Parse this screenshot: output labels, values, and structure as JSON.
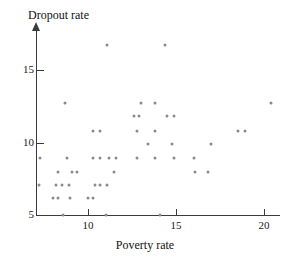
{
  "chart_data": {
    "type": "scatter",
    "title": "",
    "xlabel": "Poverty rate",
    "ylabel": "Dropout rate",
    "xlim": [
      6.6,
      21.0
    ],
    "ylim": [
      5.0,
      17.3
    ],
    "xticks": [
      10,
      15,
      20
    ],
    "xtick_labels": [
      "10",
      "15",
      "20"
    ],
    "yticks": [
      5,
      10,
      15
    ],
    "ytick_labels": [
      "5",
      "10",
      "15"
    ],
    "grid": false,
    "legend": null,
    "marker": "dot",
    "marker_color": "#8b8b8f",
    "axis_color": "#3b3b3b",
    "points": [
      {
        "x": 11.1,
        "y": 16.7
      },
      {
        "x": 14.4,
        "y": 16.7
      },
      {
        "x": 8.7,
        "y": 12.7
      },
      {
        "x": 13.0,
        "y": 12.7
      },
      {
        "x": 13.8,
        "y": 12.7
      },
      {
        "x": 20.4,
        "y": 12.7
      },
      {
        "x": 12.6,
        "y": 11.8
      },
      {
        "x": 12.9,
        "y": 11.8
      },
      {
        "x": 14.5,
        "y": 11.8
      },
      {
        "x": 14.9,
        "y": 11.8
      },
      {
        "x": 10.3,
        "y": 10.8
      },
      {
        "x": 10.7,
        "y": 10.8
      },
      {
        "x": 12.8,
        "y": 10.8
      },
      {
        "x": 13.8,
        "y": 10.8
      },
      {
        "x": 18.5,
        "y": 10.8
      },
      {
        "x": 18.9,
        "y": 10.8
      },
      {
        "x": 13.4,
        "y": 9.9
      },
      {
        "x": 14.8,
        "y": 9.9
      },
      {
        "x": 17.0,
        "y": 9.9
      },
      {
        "x": 7.3,
        "y": 8.9
      },
      {
        "x": 8.8,
        "y": 8.9
      },
      {
        "x": 10.3,
        "y": 8.9
      },
      {
        "x": 10.7,
        "y": 8.9
      },
      {
        "x": 11.2,
        "y": 8.9
      },
      {
        "x": 11.6,
        "y": 8.9
      },
      {
        "x": 12.8,
        "y": 8.9
      },
      {
        "x": 13.8,
        "y": 8.9
      },
      {
        "x": 14.9,
        "y": 8.9
      },
      {
        "x": 16.0,
        "y": 8.9
      },
      {
        "x": 8.3,
        "y": 8.0
      },
      {
        "x": 9.1,
        "y": 8.0
      },
      {
        "x": 9.4,
        "y": 8.0
      },
      {
        "x": 11.5,
        "y": 8.0
      },
      {
        "x": 16.1,
        "y": 8.0
      },
      {
        "x": 16.8,
        "y": 8.0
      },
      {
        "x": 7.2,
        "y": 7.1
      },
      {
        "x": 8.2,
        "y": 7.1
      },
      {
        "x": 8.5,
        "y": 7.1
      },
      {
        "x": 8.9,
        "y": 7.1
      },
      {
        "x": 10.4,
        "y": 7.1
      },
      {
        "x": 10.7,
        "y": 7.1
      },
      {
        "x": 11.1,
        "y": 7.1
      },
      {
        "x": 8.0,
        "y": 6.2
      },
      {
        "x": 8.3,
        "y": 6.2
      },
      {
        "x": 9.0,
        "y": 6.2
      },
      {
        "x": 10.0,
        "y": 6.2
      },
      {
        "x": 10.3,
        "y": 6.2
      },
      {
        "x": 8.6,
        "y": 5.0
      },
      {
        "x": 11.0,
        "y": 5.0
      },
      {
        "x": 14.1,
        "y": 5.0
      }
    ]
  }
}
